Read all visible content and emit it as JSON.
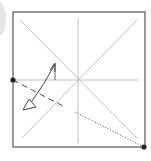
{
  "diagram": {
    "type": "origami-fold-diagram",
    "colors": {
      "paper_edge": "#555555",
      "crease": "#b0b0b0",
      "fold_line": "#444444",
      "dot": "#222222",
      "arrow": "#444444"
    },
    "square": {
      "x": 13,
      "y": 12,
      "width": 132,
      "height": 135
    },
    "creases": [
      {
        "name": "diagonal-tl-br",
        "x1": 20,
        "y1": 20,
        "x2": 137,
        "y2": 138
      },
      {
        "name": "diagonal-tr-bl",
        "x1": 137,
        "y1": 20,
        "x2": 22,
        "y2": 138
      },
      {
        "name": "vertical-center",
        "x1": 78,
        "y1": 18,
        "x2": 78,
        "y2": 143
      },
      {
        "name": "horizontal-center",
        "x1": 13,
        "y1": 80,
        "x2": 138,
        "y2": 80
      }
    ],
    "valley_fold": {
      "x1": 13,
      "y1": 80,
      "x2": 65,
      "y2": 107
    },
    "dotted_guide": {
      "x1": 75,
      "y1": 112,
      "x2": 144,
      "y2": 147
    },
    "reference_points": [
      {
        "name": "left-edge-point",
        "cx": 13,
        "cy": 80
      },
      {
        "name": "bottom-right-corner-point",
        "cx": 144,
        "cy": 147
      }
    ]
  }
}
